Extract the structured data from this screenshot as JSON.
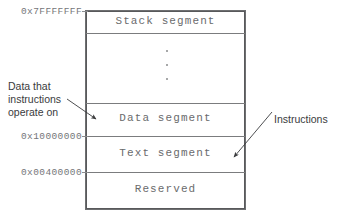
{
  "diagram": {
    "line_color": "#58595b",
    "label_color": "#6a6b6d",
    "annotation_color": "#3a3b3d",
    "background": "#ffffff"
  },
  "segments": [
    {
      "id": "stack",
      "label": "Stack segment",
      "top_address": "0x7FFFFFFF"
    },
    {
      "id": "gap",
      "label": "",
      "top_address": ""
    },
    {
      "id": "data",
      "label": "Data segment",
      "top_address": ""
    },
    {
      "id": "text",
      "label": "Text segment",
      "top_address": "0x10000000"
    },
    {
      "id": "reserved",
      "label": "Reserved",
      "top_address": "0x00400000"
    }
  ],
  "addresses": {
    "stack_top": "0x7FFFFFFF",
    "text_top": "0x10000000",
    "reserved_top": "0x00400000"
  },
  "labels": {
    "stack": "Stack segment",
    "data": "Data segment",
    "text": "Text segment",
    "reserved": "Reserved"
  },
  "annotations": {
    "left": {
      "line1": "Data that",
      "line2": "instructions",
      "line3": "operate on",
      "points_to": "data"
    },
    "right": {
      "line1": "Instructions",
      "points_to": "text"
    }
  },
  "ellipsis": {
    "dots": 3,
    "meaning": "unused address space"
  }
}
